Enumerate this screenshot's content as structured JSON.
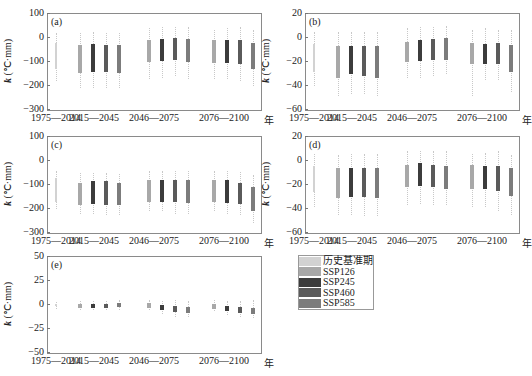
{
  "legend": {
    "items": [
      {
        "label": "历史基准期",
        "color": "#d2d2d2"
      },
      {
        "label": "SSP126",
        "color": "#a8a8a8"
      },
      {
        "label": "SSP245",
        "color": "#3c3c3c"
      },
      {
        "label": "SSP460",
        "color": "#5a5a5a"
      },
      {
        "label": "SSP585",
        "color": "#7c7c7c"
      }
    ]
  },
  "x_unit": "年",
  "x_groups": [
    "1975—2014",
    "2015—2045",
    "2046—2075",
    "2076—2100"
  ],
  "ylabel": "k (℃·mm)",
  "chart_data": [
    {
      "type": "box",
      "panel": "(a)",
      "ylabel": "k (℃·mm)",
      "ylim": [
        -300,
        100
      ],
      "yticks": [
        "100",
        "0",
        "−100",
        "−200",
        "−300"
      ],
      "categories": [
        "1975—2014",
        "2015—2045",
        "2046—2075",
        "2076—2100"
      ],
      "series": [
        {
          "name": "历史基准期",
          "boxes": [
            {
              "group": "1975—2014",
              "q1": -130,
              "q3": -20,
              "min": -180,
              "max": 20
            }
          ]
        },
        {
          "name": "SSP126",
          "boxes": [
            {
              "group": "2015—2045",
              "q1": -145,
              "q3": -30,
              "min": -210,
              "max": 20
            },
            {
              "group": "2046—2075",
              "q1": -100,
              "q3": -10,
              "min": -170,
              "max": 40
            },
            {
              "group": "2076—2100",
              "q1": -105,
              "q3": -10,
              "min": -170,
              "max": 35
            }
          ]
        },
        {
          "name": "SSP245",
          "boxes": [
            {
              "group": "2015—2045",
              "q1": -140,
              "q3": -25,
              "min": -210,
              "max": 25
            },
            {
              "group": "2046—2075",
              "q1": -95,
              "q3": -5,
              "min": -165,
              "max": 45
            },
            {
              "group": "2076—2100",
              "q1": -105,
              "q3": -10,
              "min": -170,
              "max": 40
            }
          ]
        },
        {
          "name": "SSP460",
          "boxes": [
            {
              "group": "2015—2045",
              "q1": -140,
              "q3": -30,
              "min": -210,
              "max": 20
            },
            {
              "group": "2046—2075",
              "q1": -90,
              "q3": 0,
              "min": -160,
              "max": 45
            },
            {
              "group": "2076—2100",
              "q1": -110,
              "q3": -10,
              "min": -180,
              "max": 45
            }
          ]
        },
        {
          "name": "SSP585",
          "boxes": [
            {
              "group": "2015—2045",
              "q1": -145,
              "q3": -30,
              "min": -210,
              "max": 20
            },
            {
              "group": "2046—2075",
              "q1": -100,
              "q3": -5,
              "min": -170,
              "max": 45
            },
            {
              "group": "2076—2100",
              "q1": -130,
              "q3": -20,
              "min": -200,
              "max": 35
            }
          ]
        }
      ]
    },
    {
      "type": "box",
      "panel": "(b)",
      "ylabel": "k (℃·mm)",
      "ylim": [
        -60,
        20
      ],
      "yticks": [
        "20",
        "0",
        "−20",
        "−40",
        "−60"
      ],
      "categories": [
        "1975—2014",
        "2015—2045",
        "2046—2075",
        "2076—2100"
      ],
      "series": [
        {
          "name": "历史基准期",
          "boxes": [
            {
              "group": "1975—2014",
              "q1": -28,
              "q3": -5,
              "min": -40,
              "max": 5
            }
          ]
        },
        {
          "name": "SSP126",
          "boxes": [
            {
              "group": "2015—2045",
              "q1": -33,
              "q3": -7,
              "min": -48,
              "max": 5
            },
            {
              "group": "2046—2075",
              "q1": -20,
              "q3": -3,
              "min": -33,
              "max": 8
            },
            {
              "group": "2076—2100",
              "q1": -22,
              "q3": -4,
              "min": -48,
              "max": 7
            }
          ]
        },
        {
          "name": "SSP245",
          "boxes": [
            {
              "group": "2015—2045",
              "q1": -30,
              "q3": -7,
              "min": -47,
              "max": 5
            },
            {
              "group": "2046—2075",
              "q1": -19,
              "q3": -2,
              "min": -33,
              "max": 9
            },
            {
              "group": "2076—2100",
              "q1": -22,
              "q3": -5,
              "min": -35,
              "max": 8
            }
          ]
        },
        {
          "name": "SSP460",
          "boxes": [
            {
              "group": "2015—2045",
              "q1": -32,
              "q3": -7,
              "min": -47,
              "max": 5
            },
            {
              "group": "2046—2075",
              "q1": -18,
              "q3": -1,
              "min": -32,
              "max": 9
            },
            {
              "group": "2076—2100",
              "q1": -22,
              "q3": -4,
              "min": -35,
              "max": 7
            }
          ]
        },
        {
          "name": "SSP585",
          "boxes": [
            {
              "group": "2015—2045",
              "q1": -33,
              "q3": -7,
              "min": -48,
              "max": 5
            },
            {
              "group": "2046—2075",
              "q1": -18,
              "q3": 0,
              "min": -30,
              "max": 10
            },
            {
              "group": "2076—2100",
              "q1": -28,
              "q3": -6,
              "min": -45,
              "max": 7
            }
          ]
        }
      ]
    },
    {
      "type": "box",
      "panel": "(c)",
      "ylabel": "k (℃·mm)",
      "ylim": [
        -300,
        100
      ],
      "yticks": [
        "100",
        "0",
        "−100",
        "−200",
        "−300"
      ],
      "categories": [
        "1975—2014",
        "2015—2045",
        "2046—2075",
        "2076—2100"
      ],
      "series": [
        {
          "name": "历史基准期",
          "boxes": [
            {
              "group": "1975—2014",
              "q1": -170,
              "q3": -70,
              "min": -200,
              "max": -40
            }
          ]
        },
        {
          "name": "SSP126",
          "boxes": [
            {
              "group": "2015—2045",
              "q1": -185,
              "q3": -90,
              "min": -220,
              "max": -50
            },
            {
              "group": "2046—2075",
              "q1": -170,
              "q3": -80,
              "min": -210,
              "max": -40
            },
            {
              "group": "2076—2100",
              "q1": -170,
              "q3": -80,
              "min": -210,
              "max": -40
            }
          ]
        },
        {
          "name": "SSP245",
          "boxes": [
            {
              "group": "2015—2045",
              "q1": -180,
              "q3": -85,
              "min": -220,
              "max": -50
            },
            {
              "group": "2046—2075",
              "q1": -170,
              "q3": -80,
              "min": -210,
              "max": -40
            },
            {
              "group": "2076—2100",
              "q1": -175,
              "q3": -80,
              "min": -220,
              "max": -40
            }
          ]
        },
        {
          "name": "SSP460",
          "boxes": [
            {
              "group": "2015—2045",
              "q1": -185,
              "q3": -85,
              "min": -225,
              "max": -50
            },
            {
              "group": "2046—2075",
              "q1": -170,
              "q3": -78,
              "min": -220,
              "max": -40
            },
            {
              "group": "2076—2100",
              "q1": -180,
              "q3": -90,
              "min": -225,
              "max": -45
            }
          ]
        },
        {
          "name": "SSP585",
          "boxes": [
            {
              "group": "2015—2045",
              "q1": -185,
              "q3": -90,
              "min": -225,
              "max": -55
            },
            {
              "group": "2046—2075",
              "q1": -175,
              "q3": -80,
              "min": -220,
              "max": -40
            },
            {
              "group": "2076—2100",
              "q1": -210,
              "q3": -110,
              "min": -260,
              "max": -60
            }
          ]
        }
      ]
    },
    {
      "type": "box",
      "panel": "(d)",
      "ylabel": "k (℃·mm)",
      "ylim": [
        -60,
        20
      ],
      "yticks": [
        "20",
        "0",
        "−20",
        "−40",
        "−60"
      ],
      "categories": [
        "1975—2014",
        "2015—2045",
        "2046—2075",
        "2076—2100"
      ],
      "series": [
        {
          "name": "历史基准期",
          "boxes": [
            {
              "group": "1975—2014",
              "q1": -26,
              "q3": -4,
              "min": -38,
              "max": 6
            }
          ]
        },
        {
          "name": "SSP126",
          "boxes": [
            {
              "group": "2015—2045",
              "q1": -31,
              "q3": -6,
              "min": -45,
              "max": 5
            },
            {
              "group": "2046—2075",
              "q1": -22,
              "q3": -3,
              "min": -37,
              "max": 8
            },
            {
              "group": "2076—2100",
              "q1": -23,
              "q3": -3,
              "min": -38,
              "max": 6
            }
          ]
        },
        {
          "name": "SSP245",
          "boxes": [
            {
              "group": "2015—2045",
              "q1": -30,
              "q3": -6,
              "min": -45,
              "max": 6
            },
            {
              "group": "2046—2075",
              "q1": -21,
              "q3": -2,
              "min": -36,
              "max": 8
            },
            {
              "group": "2076—2100",
              "q1": -23,
              "q3": -4,
              "min": -38,
              "max": 7
            }
          ]
        },
        {
          "name": "SSP460",
          "boxes": [
            {
              "group": "2015—2045",
              "q1": -30,
              "q3": -6,
              "min": -46,
              "max": 6
            },
            {
              "group": "2046—2075",
              "q1": -22,
              "q3": -3,
              "min": -37,
              "max": 8
            },
            {
              "group": "2076—2100",
              "q1": -25,
              "q3": -4,
              "min": -42,
              "max": 8
            }
          ]
        },
        {
          "name": "SSP585",
          "boxes": [
            {
              "group": "2015—2045",
              "q1": -31,
              "q3": -6,
              "min": -46,
              "max": 6
            },
            {
              "group": "2046—2075",
              "q1": -23,
              "q3": -4,
              "min": -37,
              "max": 8
            },
            {
              "group": "2076—2100",
              "q1": -29,
              "q3": -6,
              "min": -45,
              "max": 5
            }
          ]
        }
      ]
    },
    {
      "type": "box",
      "panel": "(e)",
      "ylabel": "k (℃·mm)",
      "ylim": [
        -50,
        50
      ],
      "yticks": [
        "50",
        "25",
        "0",
        "−25",
        "−50"
      ],
      "categories": [
        "1975—2014",
        "2015—2045",
        "2046—2075",
        "2076—2100"
      ],
      "series": [
        {
          "name": "历史基准期",
          "boxes": [
            {
              "group": "1975—2014",
              "q1": -1,
              "q3": 1,
              "min": -4,
              "max": 3
            }
          ]
        },
        {
          "name": "SSP126",
          "boxes": [
            {
              "group": "2015—2045",
              "q1": -3,
              "q3": 1,
              "min": -5,
              "max": 4
            },
            {
              "group": "2046—2075",
              "q1": -3,
              "q3": 2,
              "min": -5,
              "max": 5
            },
            {
              "group": "2076—2100",
              "q1": -4,
              "q3": 1,
              "min": -6,
              "max": 5
            }
          ]
        },
        {
          "name": "SSP245",
          "boxes": [
            {
              "group": "2015—2045",
              "q1": -3,
              "q3": 1,
              "min": -5,
              "max": 4
            },
            {
              "group": "2046—2075",
              "q1": -5,
              "q3": 0,
              "min": -9,
              "max": 4
            },
            {
              "group": "2076—2100",
              "q1": -6,
              "q3": -1,
              "min": -10,
              "max": 4
            }
          ]
        },
        {
          "name": "SSP460",
          "boxes": [
            {
              "group": "2015—2045",
              "q1": -3,
              "q3": 1,
              "min": -5,
              "max": 4
            },
            {
              "group": "2046—2075",
              "q1": -7,
              "q3": -1,
              "min": -12,
              "max": 5
            },
            {
              "group": "2076—2100",
              "q1": -8,
              "q3": -2,
              "min": -13,
              "max": 4
            }
          ]
        },
        {
          "name": "SSP585",
          "boxes": [
            {
              "group": "2015—2045",
              "q1": -2,
              "q3": 2,
              "min": -5,
              "max": 5
            },
            {
              "group": "2046—2075",
              "q1": -8,
              "q3": -2,
              "min": -13,
              "max": 4
            },
            {
              "group": "2076—2100",
              "q1": -9,
              "q3": -3,
              "min": -14,
              "max": 5
            }
          ]
        }
      ]
    }
  ]
}
